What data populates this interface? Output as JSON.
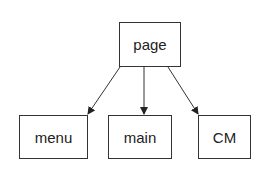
{
  "diagram": {
    "type": "tree",
    "nodes": [
      {
        "id": "page",
        "label": "page",
        "x": 119,
        "y": 22,
        "w": 62,
        "h": 45
      },
      {
        "id": "menu",
        "label": "menu",
        "x": 19,
        "y": 115,
        "w": 69,
        "h": 44
      },
      {
        "id": "main",
        "label": "main",
        "x": 108,
        "y": 115,
        "w": 64,
        "h": 44
      },
      {
        "id": "CM",
        "label": "CM",
        "x": 198,
        "y": 115,
        "w": 53,
        "h": 44
      }
    ],
    "edges": [
      {
        "from": "page",
        "to": "menu"
      },
      {
        "from": "page",
        "to": "main"
      },
      {
        "from": "page",
        "to": "CM"
      }
    ],
    "colors": {
      "stroke": "#333333",
      "text": "#222222",
      "background": "#ffffff"
    }
  }
}
